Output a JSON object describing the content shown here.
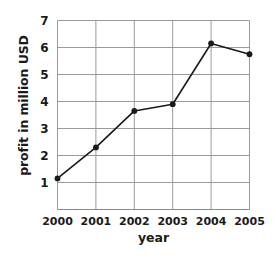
{
  "chart_data": {
    "type": "line",
    "title": "",
    "xlabel": "year",
    "ylabel": "profit in million USD",
    "categories": [
      "2000",
      "2001",
      "2002",
      "2003",
      "2004",
      "2005"
    ],
    "x": [
      2000,
      2001,
      2002,
      2003,
      2004,
      2005
    ],
    "values": [
      1.15,
      2.3,
      3.65,
      3.9,
      6.15,
      5.75
    ],
    "series": [
      {
        "name": "profit",
        "values": [
          1.15,
          2.3,
          3.65,
          3.9,
          6.15,
          5.75
        ]
      }
    ],
    "ylim": [
      0,
      7
    ],
    "xlim": [
      2000,
      2005
    ],
    "yticks": [
      1,
      2,
      3,
      4,
      5,
      6,
      7
    ],
    "ytick_labels": [
      "1",
      "2",
      "3",
      "4",
      "5",
      "6",
      "7"
    ],
    "xticks": [
      2000,
      2001,
      2002,
      2003,
      2004,
      2005
    ],
    "xtick_labels": [
      "2000",
      "2001",
      "2002",
      "2003",
      "2004",
      "2005"
    ],
    "grid": true,
    "legend": "none",
    "marker": "filled-circle",
    "line_color": "#1a1a1a",
    "marker_color": "#1a1a1a",
    "grid_color": "#9a9a9a",
    "axis_color": "#8a8a8a",
    "background_color": "#ffffff",
    "annotations": []
  }
}
